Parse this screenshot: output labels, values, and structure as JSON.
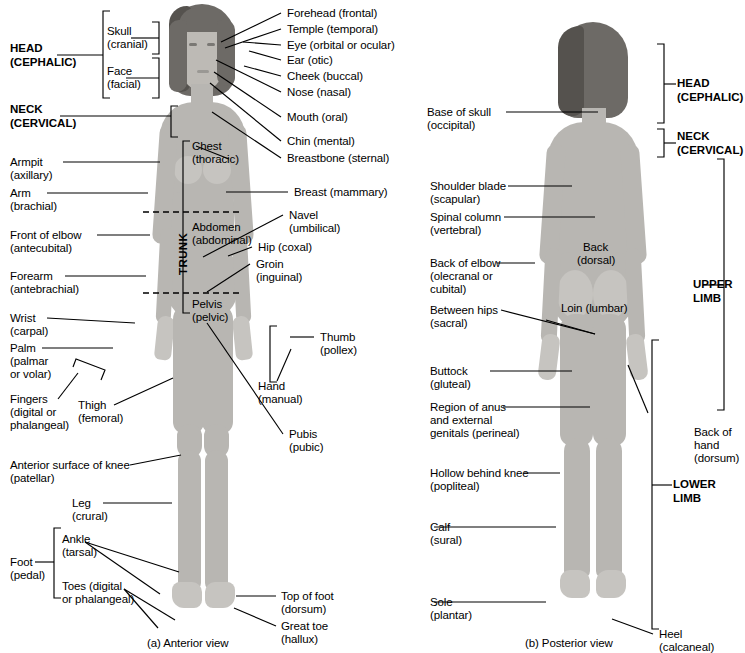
{
  "figure": {
    "panels": [
      {
        "id": "a",
        "caption": "(a) Anterior view"
      },
      {
        "id": "b",
        "caption": "(b) Posterior view"
      }
    ]
  },
  "anterior": {
    "major_regions": [
      {
        "name": "head",
        "line1": "HEAD",
        "line2": "(CEPHALIC)"
      },
      {
        "name": "neck",
        "line1": "NECK",
        "line2": "(CERVICAL)"
      }
    ],
    "trunk_label": "TRUNK",
    "sub_brackets": [
      {
        "name": "skull",
        "line1": "Skull",
        "line2": "(cranial)"
      },
      {
        "name": "face",
        "line1": "Face",
        "line2": "(facial)"
      }
    ],
    "left_labels": [
      {
        "name": "armpit",
        "line1": "Armpit",
        "line2": "(axillary)"
      },
      {
        "name": "arm",
        "line1": "Arm",
        "line2": "(brachial)"
      },
      {
        "name": "front-of-elbow",
        "line1": "Front of elbow",
        "line2": "(antecubital)"
      },
      {
        "name": "forearm",
        "line1": "Forearm",
        "line2": "(antebrachial)"
      },
      {
        "name": "wrist",
        "line1": "Wrist",
        "line2": "(carpal)"
      },
      {
        "name": "palm",
        "line1": "Palm",
        "line2": "(palmar",
        "line3": "or volar)"
      },
      {
        "name": "fingers",
        "line1": "Fingers",
        "line2": "(digital or",
        "line3": "phalangeal)"
      },
      {
        "name": "thigh",
        "line1": "Thigh",
        "line2": "(femoral)"
      },
      {
        "name": "knee",
        "line1": "Anterior surface of knee",
        "line2": "(patellar)"
      },
      {
        "name": "leg",
        "line1": "Leg",
        "line2": "(crural)"
      },
      {
        "name": "ankle",
        "line1": "Ankle",
        "line2": "(tarsal)"
      },
      {
        "name": "toes",
        "line1": "Toes (digital",
        "line2": "or phalangeal)"
      },
      {
        "name": "foot",
        "line1": "Foot",
        "line2": "(pedal)"
      }
    ],
    "right_labels": [
      {
        "name": "forehead",
        "line1": "Forehead (frontal)"
      },
      {
        "name": "temple",
        "line1": "Temple (temporal)"
      },
      {
        "name": "eye",
        "line1": "Eye (orbital or ocular)"
      },
      {
        "name": "ear",
        "line1": "Ear (otic)"
      },
      {
        "name": "cheek",
        "line1": "Cheek (buccal)"
      },
      {
        "name": "nose",
        "line1": "Nose (nasal)"
      },
      {
        "name": "mouth",
        "line1": "Mouth (oral)"
      },
      {
        "name": "chin",
        "line1": "Chin (mental)"
      },
      {
        "name": "breastbone",
        "line1": "Breastbone (sternal)"
      },
      {
        "name": "breast",
        "line1": "Breast (mammary)"
      },
      {
        "name": "navel",
        "line1": "Navel",
        "line2": "(umbilical)"
      },
      {
        "name": "hip",
        "line1": "Hip (coxal)"
      },
      {
        "name": "groin",
        "line1": "Groin",
        "line2": "(inguinal)"
      },
      {
        "name": "thumb",
        "line1": "Thumb",
        "line2": "(pollex)"
      },
      {
        "name": "hand",
        "line1": "Hand",
        "line2": "(manual)"
      },
      {
        "name": "pubis",
        "line1": "Pubis",
        "line2": "(pubic)"
      },
      {
        "name": "top-of-foot",
        "line1": "Top of foot",
        "line2": "(dorsum)"
      },
      {
        "name": "great-toe",
        "line1": "Great toe",
        "line2": "(hallux)"
      }
    ],
    "trunk_regions": [
      {
        "name": "chest",
        "line1": "Chest",
        "line2": "(thoracic)"
      },
      {
        "name": "abdomen",
        "line1": "Abdomen",
        "line2": "(abdominal)"
      },
      {
        "name": "pelvis",
        "line1": "Pelvis",
        "line2": "(pelvic)"
      }
    ]
  },
  "posterior": {
    "left_labels": [
      {
        "name": "base-of-skull",
        "line1": "Base of skull",
        "line2": "(occipital)"
      },
      {
        "name": "shoulder-blade",
        "line1": "Shoulder blade",
        "line2": "(scapular)"
      },
      {
        "name": "spinal-column",
        "line1": "Spinal column",
        "line2": "(vertebral)"
      },
      {
        "name": "back-of-elbow",
        "line1": "Back of elbow",
        "line2": "(olecranal or",
        "line3": "cubital)"
      },
      {
        "name": "between-hips",
        "line1": "Between hips",
        "line2": "(sacral)"
      },
      {
        "name": "buttock",
        "line1": "Buttock",
        "line2": "(gluteal)"
      },
      {
        "name": "perineal",
        "line1": "Region of anus",
        "line2": "and external",
        "line3": "genitals (perineal)"
      },
      {
        "name": "popliteal",
        "line1": "Hollow behind knee",
        "line2": "(popliteal)"
      },
      {
        "name": "calf",
        "line1": "Calf",
        "line2": "(sural)"
      },
      {
        "name": "sole",
        "line1": "Sole",
        "line2": "(plantar)"
      }
    ],
    "center_labels": [
      {
        "name": "back",
        "line1": "Back",
        "line2": "(dorsal)"
      },
      {
        "name": "loin",
        "line1": "Loin (lumbar)"
      }
    ],
    "right_labels": [
      {
        "name": "head",
        "line1": "HEAD",
        "line2": "(CEPHALIC)",
        "bold": true
      },
      {
        "name": "neck",
        "line1": "NECK",
        "line2": "(CERVICAL)",
        "bold": true
      },
      {
        "name": "upper-limb",
        "line1": "UPPER",
        "line2": "LIMB",
        "bold": true
      },
      {
        "name": "lower-limb",
        "line1": "LOWER",
        "line2": "LIMB",
        "bold": true
      },
      {
        "name": "back-of-hand",
        "line1": "Back of",
        "line2": "hand",
        "line3": "(dorsum)"
      },
      {
        "name": "heel",
        "line1": "Heel",
        "line2": "(calcaneal)"
      }
    ]
  },
  "colors": {
    "background": "#ffffff",
    "ink": "#000000",
    "skin": "#b8b6b2",
    "skin_light": "#c6c4c0",
    "skin_dark": "#a8a6a2",
    "hair": "#6d6a66"
  }
}
